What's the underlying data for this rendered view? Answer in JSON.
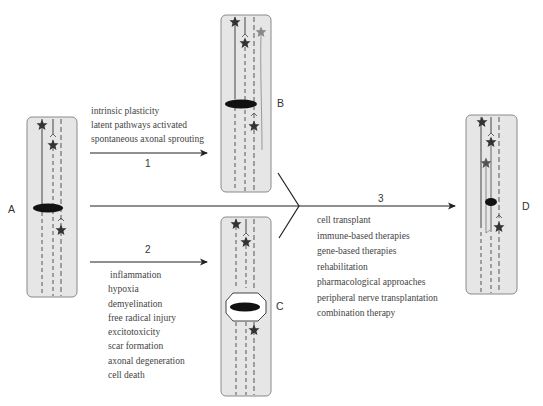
{
  "panels": {
    "A": {
      "label": "A"
    },
    "B": {
      "label": "B"
    },
    "C": {
      "label": "C"
    },
    "D": {
      "label": "D"
    }
  },
  "arrows": {
    "1": {
      "number": "1",
      "items": [
        "intrinsic plasticity",
        "latent pathways activated",
        "spontaneous axonal sprouting"
      ]
    },
    "2": {
      "number": "2",
      "items": [
        "inflammation",
        "hypoxia",
        "demyelination",
        "free radical injury",
        "excitotoxicity",
        "scar formation",
        "axonal degeneration",
        "cell death"
      ]
    },
    "3": {
      "number": "3",
      "items": [
        "cell transplant",
        "immune-based therapies",
        "gene-based therapies",
        "rehabilitation",
        "pharmacological approaches",
        "peripheral nerve transplantation",
        "combination therapy"
      ]
    }
  },
  "colors": {
    "panel_fill": "#e6e6e6",
    "panel_border": "#888888",
    "star_dark": "#333333",
    "star_gray": "#888888",
    "lesion": "#111111"
  }
}
